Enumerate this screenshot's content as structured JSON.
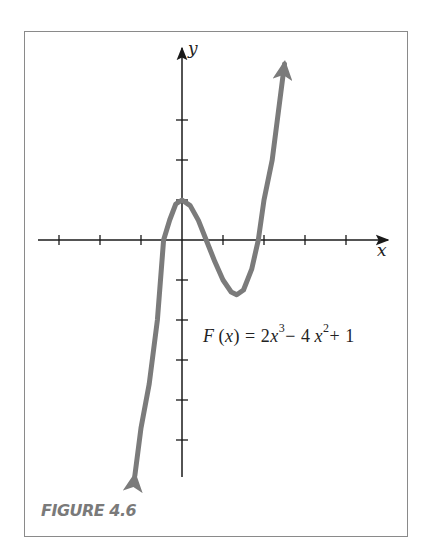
{
  "figure": {
    "caption": "FIGURE 4.6",
    "equation": {
      "lhs_func": "F",
      "lhs_var": "x",
      "text": "F(x) = 2x^3 − 4x^2 + 1",
      "parts": [
        "= 2",
        "x",
        "3",
        "− 4",
        "x",
        "2",
        "+ 1"
      ]
    },
    "x_axis_label": "x",
    "y_axis_label": "y",
    "colors": {
      "curve": "#7b7b7b",
      "axis": "#1a1a1a",
      "frame": "#8a8a8a",
      "caption": "#7a7a7a"
    }
  },
  "chart_data": {
    "type": "line",
    "title": "",
    "function": "F(x) = 2x^3 - 4x^2 + 1",
    "xlabel": "x",
    "ylabel": "y",
    "xlim": [
      -3.4,
      5.0
    ],
    "ylim": [
      -6,
      5
    ],
    "x_ticks": [
      -3,
      -2,
      -1,
      1,
      2,
      3,
      4
    ],
    "y_ticks": [
      -5,
      -4,
      -3,
      -2,
      -1,
      1,
      2,
      3
    ],
    "tick_labels_shown": false,
    "grid": false,
    "legend": null,
    "key_points": {
      "y_intercept": [
        0,
        1
      ],
      "local_max": [
        0,
        1
      ],
      "local_min": [
        1.333,
        -1.37
      ],
      "roots": [
        -0.45,
        0.59,
        1.86
      ]
    },
    "series": [
      {
        "name": "F(x)",
        "x": [
          -1.15,
          -1.0,
          -0.8,
          -0.6,
          -0.45,
          -0.3,
          -0.15,
          0,
          0.2,
          0.4,
          0.59,
          0.8,
          1.0,
          1.2,
          1.333,
          1.5,
          1.7,
          1.86,
          2.0,
          2.2,
          2.5
        ],
        "y": [
          -5.9,
          -4.7,
          -3.6,
          -2.0,
          0,
          0.5,
          0.9,
          1.0,
          0.86,
          0.49,
          0,
          -0.54,
          -1.0,
          -1.3,
          -1.37,
          -1.25,
          -0.73,
          0,
          1.0,
          2.0,
          4.4
        ]
      }
    ],
    "arrows": {
      "curve_ends": true,
      "positive_x_axis": true,
      "positive_y_axis": true
    }
  }
}
